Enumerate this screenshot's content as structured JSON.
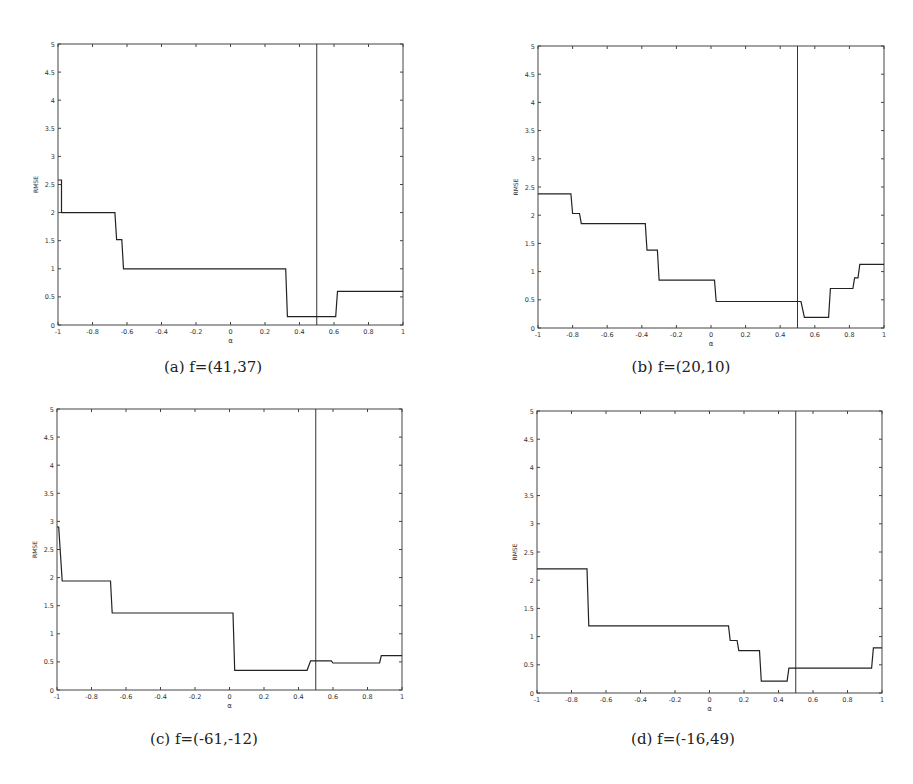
{
  "figure": {
    "panels": [
      "a",
      "b",
      "c",
      "d"
    ]
  },
  "captions": {
    "a": "(a) f=(41,37)",
    "b": "(b) f=(20,10)",
    "c": "(c) f=(-61,-12)",
    "d": "(d) f=(-16,49)"
  },
  "chart_data": [
    {
      "id": "a",
      "type": "line",
      "title": "(a) f=(41,37)",
      "xlabel": "α",
      "ylabel": "RMSE",
      "xlim": [
        -1,
        1
      ],
      "ylim": [
        0,
        5
      ],
      "xticks": [
        -1,
        -0.8,
        -0.6,
        -0.4,
        -0.2,
        0,
        0.2,
        0.4,
        0.6,
        0.8,
        1
      ],
      "yticks": [
        0,
        0.5,
        1,
        1.5,
        2,
        2.5,
        3,
        3.5,
        4,
        4.5,
        5
      ],
      "grid": false,
      "vline": 0.5,
      "step_series": {
        "x": [
          -1,
          -0.98,
          -0.98,
          -0.67,
          -0.66,
          -0.63,
          -0.62,
          0.32,
          0.33,
          0.61,
          0.62,
          1
        ],
        "y": [
          2.58,
          2.58,
          2.0,
          2.0,
          1.52,
          1.52,
          1.0,
          1.0,
          0.15,
          0.15,
          0.6,
          0.6
        ]
      },
      "box": {
        "x0": 58,
        "y0": 44,
        "x1": 403,
        "y1": 325
      },
      "caption_pos": {
        "x": 213,
        "y": 368
      }
    },
    {
      "id": "b",
      "type": "line",
      "title": "(b) f=(20,10)",
      "xlabel": "α",
      "ylabel": "RMSE",
      "xlim": [
        -1,
        1
      ],
      "ylim": [
        0,
        5
      ],
      "xticks": [
        -1,
        -0.8,
        -0.6,
        -0.4,
        -0.2,
        0,
        0.2,
        0.4,
        0.6,
        0.8,
        1
      ],
      "yticks": [
        0,
        0.5,
        1,
        1.5,
        2,
        2.5,
        3,
        3.5,
        4,
        4.5,
        5
      ],
      "grid": false,
      "vline": 0.5,
      "step_series": {
        "x": [
          -1,
          -0.81,
          -0.8,
          -0.76,
          -0.75,
          -0.38,
          -0.37,
          -0.31,
          -0.3,
          0.02,
          0.03,
          0.52,
          0.54,
          0.68,
          0.69,
          0.82,
          0.83,
          0.85,
          0.86,
          1
        ],
        "y": [
          2.38,
          2.38,
          2.03,
          2.03,
          1.85,
          1.85,
          1.38,
          1.38,
          0.85,
          0.85,
          0.47,
          0.47,
          0.19,
          0.19,
          0.7,
          0.7,
          0.89,
          0.89,
          1.13,
          1.13
        ]
      },
      "box": {
        "x0": 538,
        "y0": 46,
        "x1": 884,
        "y1": 328
      },
      "caption_pos": {
        "x": 681,
        "y": 368
      }
    },
    {
      "id": "c",
      "type": "line",
      "title": "(c) f=(-61,-12)",
      "xlabel": "α",
      "ylabel": "RMSE",
      "xlim": [
        -1,
        1
      ],
      "ylim": [
        0,
        5
      ],
      "xticks": [
        -1,
        -0.8,
        -0.6,
        -0.4,
        -0.2,
        0,
        0.2,
        0.4,
        0.6,
        0.8,
        1
      ],
      "yticks": [
        0,
        0.5,
        1,
        1.5,
        2,
        2.5,
        3,
        3.5,
        4,
        4.5,
        5
      ],
      "grid": false,
      "vline": 0.5,
      "step_series": {
        "x": [
          -1,
          -0.99,
          -0.97,
          -0.69,
          -0.68,
          0.02,
          0.03,
          0.45,
          0.47,
          0.59,
          0.6,
          0.87,
          0.88,
          1
        ],
        "y": [
          2.9,
          2.9,
          1.94,
          1.94,
          1.37,
          1.37,
          0.35,
          0.35,
          0.52,
          0.52,
          0.48,
          0.48,
          0.61,
          0.61
        ]
      },
      "box": {
        "x0": 57,
        "y0": 409,
        "x1": 402,
        "y1": 690
      },
      "caption_pos": {
        "x": 204,
        "y": 740
      }
    },
    {
      "id": "d",
      "type": "line",
      "title": "(d) f=(-16,49)",
      "xlabel": "α",
      "ylabel": "RMSE",
      "xlim": [
        -1,
        1
      ],
      "ylim": [
        0,
        5
      ],
      "xticks": [
        -1,
        -0.8,
        -0.6,
        -0.4,
        -0.2,
        0,
        0.2,
        0.4,
        0.6,
        0.8,
        1
      ],
      "yticks": [
        0,
        0.5,
        1,
        1.5,
        2,
        2.5,
        3,
        3.5,
        4,
        4.5,
        5
      ],
      "grid": false,
      "vline": 0.5,
      "step_series": {
        "x": [
          -1,
          -0.71,
          -0.7,
          0.11,
          0.12,
          0.16,
          0.17,
          0.29,
          0.3,
          0.45,
          0.46,
          0.94,
          0.95,
          1
        ],
        "y": [
          2.2,
          2.2,
          1.19,
          1.19,
          0.93,
          0.93,
          0.75,
          0.75,
          0.21,
          0.21,
          0.44,
          0.44,
          0.8,
          0.8
        ]
      },
      "box": {
        "x0": 537,
        "y0": 411,
        "x1": 882,
        "y1": 693
      },
      "caption_pos": {
        "x": 683,
        "y": 740
      }
    }
  ]
}
